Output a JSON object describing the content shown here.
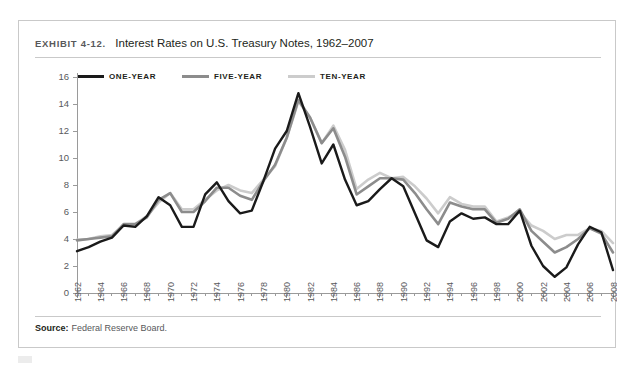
{
  "exhibit": {
    "label": "EXHIBIT 4-12.",
    "title": "Interest Rates on U.S. Treasury Notes, 1962–2007"
  },
  "source": {
    "label": "Source:",
    "text": "Federal Reserve Board."
  },
  "legend": {
    "position": "top-left",
    "entries": [
      {
        "label": "ONE-YEAR",
        "color": "#1a1a1a"
      },
      {
        "label": "FIVE-YEAR",
        "color": "#8c8c8c"
      },
      {
        "label": "TEN-YEAR",
        "color": "#cccccc"
      }
    ]
  },
  "chart_data": {
    "type": "line",
    "title": "Interest Rates on U.S. Treasury Notes, 1962–2007",
    "xlabel": "",
    "ylabel": "",
    "ylim": [
      0,
      16
    ],
    "xlim": [
      1962,
      2008
    ],
    "grid": false,
    "legend_position": "top-left",
    "yticks": [
      0,
      2,
      4,
      6,
      8,
      10,
      12,
      14,
      16
    ],
    "xticks": [
      1962,
      1964,
      1966,
      1968,
      1970,
      1972,
      1974,
      1976,
      1978,
      1980,
      1982,
      1984,
      1986,
      1988,
      1990,
      1992,
      1994,
      1996,
      1998,
      2000,
      2002,
      2004,
      2006,
      2008
    ],
    "x": [
      1962,
      1963,
      1964,
      1965,
      1966,
      1967,
      1968,
      1969,
      1970,
      1971,
      1972,
      1973,
      1974,
      1975,
      1976,
      1977,
      1978,
      1979,
      1980,
      1981,
      1982,
      1983,
      1984,
      1985,
      1986,
      1987,
      1988,
      1989,
      1990,
      1991,
      1992,
      1993,
      1994,
      1995,
      1996,
      1997,
      1998,
      1999,
      2000,
      2001,
      2002,
      2003,
      2004,
      2005,
      2006,
      2007,
      2008
    ],
    "series": [
      {
        "name": "ONE-YEAR",
        "color": "#1a1a1a",
        "values": [
          3.1,
          3.4,
          3.8,
          4.1,
          5.0,
          4.9,
          5.7,
          7.1,
          6.5,
          4.9,
          4.9,
          7.3,
          8.2,
          6.8,
          5.9,
          6.1,
          8.3,
          10.7,
          12.0,
          14.8,
          12.3,
          9.6,
          11.0,
          8.4,
          6.5,
          6.8,
          7.7,
          8.5,
          7.9,
          5.9,
          3.9,
          3.4,
          5.3,
          5.9,
          5.5,
          5.6,
          5.1,
          5.1,
          6.1,
          3.5,
          2.0,
          1.2,
          1.9,
          3.6,
          4.9,
          4.5,
          1.7
        ]
      },
      {
        "name": "FIVE-YEAR",
        "color": "#8c8c8c",
        "values": [
          3.9,
          4.0,
          4.1,
          4.2,
          5.1,
          5.1,
          5.6,
          6.9,
          7.4,
          6.0,
          6.0,
          6.8,
          7.8,
          7.8,
          7.2,
          6.9,
          8.3,
          9.5,
          11.5,
          14.3,
          13.0,
          11.1,
          12.2,
          10.1,
          7.3,
          7.9,
          8.5,
          8.5,
          8.4,
          7.4,
          6.2,
          5.1,
          6.7,
          6.4,
          6.2,
          6.2,
          5.2,
          5.5,
          6.2,
          4.6,
          3.8,
          3.0,
          3.4,
          4.0,
          4.8,
          4.4,
          3.0
        ]
      },
      {
        "name": "TEN-YEAR",
        "color": "#cccccc",
        "values": [
          3.95,
          4.0,
          4.2,
          4.3,
          5.0,
          5.1,
          5.7,
          6.7,
          7.4,
          6.2,
          6.2,
          6.9,
          7.6,
          8.0,
          7.6,
          7.4,
          8.4,
          9.4,
          11.5,
          14.2,
          13.0,
          11.1,
          12.4,
          10.6,
          7.7,
          8.4,
          8.9,
          8.5,
          8.6,
          7.9,
          7.0,
          5.9,
          7.1,
          6.6,
          6.4,
          6.4,
          5.3,
          5.6,
          6.0,
          5.0,
          4.6,
          4.0,
          4.3,
          4.3,
          4.8,
          4.6,
          3.7
        ]
      }
    ]
  }
}
